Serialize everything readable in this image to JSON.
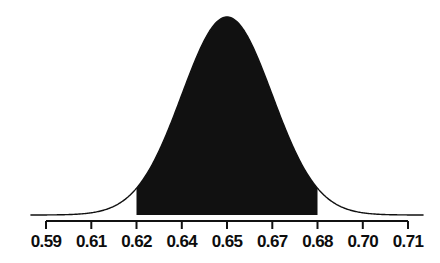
{
  "chart_data": {
    "type": "area",
    "title": "",
    "subtitle": "",
    "xlabel": "",
    "ylabel": "",
    "grid": false,
    "legend": null,
    "annotations": [],
    "distribution": {
      "kind": "normal",
      "mean": 0.65,
      "sigma": 0.015,
      "peak_label": "0.65"
    },
    "xlim": [
      0.585,
      0.715
    ],
    "ylim": [
      0,
      1
    ],
    "tick_values": [
      0.59,
      0.61,
      0.62,
      0.64,
      0.65,
      0.67,
      0.68,
      0.7,
      0.71
    ],
    "tick_labels": [
      "0.59",
      "0.61",
      "0.62",
      "0.64",
      "0.65",
      "0.67",
      "0.68",
      "0.70",
      "0.71"
    ],
    "tick_pixel_x": [
      46,
      91.3,
      136.5,
      181.8,
      227.0,
      272.3,
      317.5,
      362.8,
      408
    ],
    "shaded_region": {
      "from": 0.62,
      "to": 0.68,
      "from_pixel_x": 136.5,
      "to_pixel_x": 317.5,
      "fill_color": "#111111",
      "label": ""
    },
    "curve": {
      "stroke_color": "#111111",
      "stroke_width": 1.4,
      "peak_pixel_x": 227.0,
      "peak_pixel_y": 17,
      "baseline_pixel_y": 215
    },
    "axis": {
      "line_color": "#111111",
      "line_width": 2,
      "line_pixel_y": 221,
      "x_start_pixel": 46,
      "x_end_pixel": 408,
      "tick_length": 8,
      "tick_direction": "down"
    }
  },
  "figure": {
    "background_color": "#ffffff",
    "width": 440,
    "height": 263
  }
}
